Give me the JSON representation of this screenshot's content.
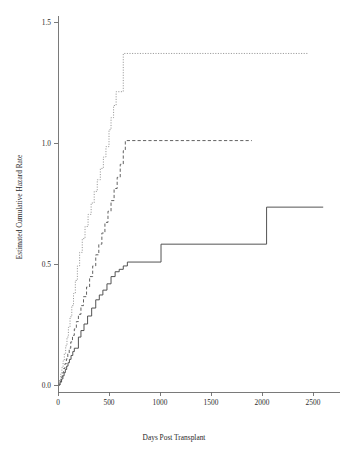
{
  "chart_data": {
    "type": "line",
    "title": "",
    "xlabel": "Days Post Transplant",
    "ylabel": "Estimated Cumulative Hazard Rate",
    "xlim": [
      -60,
      2700
    ],
    "ylim": [
      -0.04,
      1.55
    ],
    "xticks": [
      0,
      500,
      1000,
      1500,
      2000,
      2500
    ],
    "xticklabels": [
      "0",
      "500",
      "1000",
      "1500",
      "2000",
      "2500"
    ],
    "yticks": [
      0.0,
      0.5,
      1.0,
      1.5
    ],
    "yticklabels": [
      "0.0",
      "0.5",
      "1.0",
      "1.5"
    ],
    "grid": false,
    "legend": "none",
    "step_style": "post",
    "series": [
      {
        "name": "group-1-solid",
        "style": "solid",
        "color": "#4a4a4a",
        "x": [
          0,
          20,
          35,
          48,
          60,
          72,
          85,
          98,
          112,
          128,
          145,
          160,
          178,
          200,
          225,
          255,
          290,
          330,
          370,
          405,
          440,
          480,
          520,
          560,
          600,
          640,
          680,
          1010,
          2045,
          2600
        ],
        "y": [
          0.0,
          0.012,
          0.025,
          0.038,
          0.051,
          0.064,
          0.078,
          0.092,
          0.106,
          0.122,
          0.138,
          0.152,
          0.152,
          0.198,
          0.225,
          0.252,
          0.285,
          0.318,
          0.352,
          0.372,
          0.392,
          0.418,
          0.448,
          0.468,
          0.478,
          0.492,
          0.508,
          0.582,
          0.735,
          0.735
        ]
      },
      {
        "name": "group-2-dashed",
        "style": "dashed",
        "color": "#5a5a5a",
        "x": [
          0,
          18,
          30,
          42,
          55,
          68,
          82,
          96,
          110,
          125,
          142,
          160,
          180,
          200,
          225,
          250,
          280,
          310,
          340,
          370,
          400,
          430,
          460,
          490,
          520,
          550,
          580,
          610,
          640,
          660,
          1900
        ],
        "y": [
          0.0,
          0.015,
          0.032,
          0.05,
          0.068,
          0.088,
          0.108,
          0.13,
          0.152,
          0.178,
          0.205,
          0.232,
          0.262,
          0.292,
          0.328,
          0.365,
          0.405,
          0.448,
          0.492,
          0.538,
          0.582,
          0.628,
          0.672,
          0.718,
          0.762,
          0.812,
          0.858,
          0.912,
          0.968,
          1.01,
          1.01
        ]
      },
      {
        "name": "group-3-dotted",
        "style": "dotted",
        "color": "#8d8d8d",
        "x": [
          0,
          15,
          26,
          38,
          50,
          62,
          75,
          88,
          102,
          118,
          135,
          152,
          170,
          190,
          212,
          238,
          265,
          295,
          325,
          355,
          385,
          415,
          445,
          470,
          500,
          520,
          545,
          570,
          600,
          640,
          2450
        ],
        "y": [
          0.0,
          0.02,
          0.045,
          0.072,
          0.1,
          0.13,
          0.162,
          0.198,
          0.238,
          0.282,
          0.328,
          0.378,
          0.432,
          0.492,
          0.548,
          0.605,
          0.655,
          0.705,
          0.752,
          0.8,
          0.848,
          0.895,
          0.942,
          0.985,
          1.055,
          1.105,
          1.155,
          1.212,
          1.212,
          1.37,
          1.37
        ]
      }
    ]
  }
}
